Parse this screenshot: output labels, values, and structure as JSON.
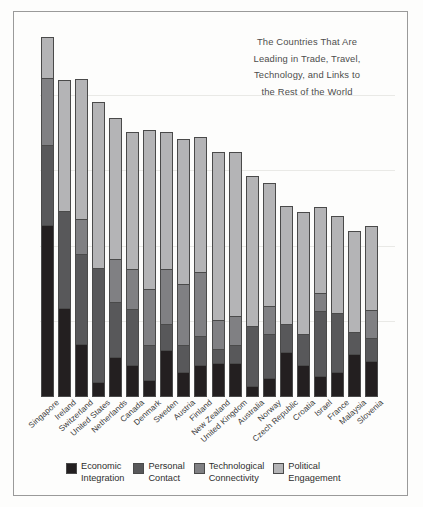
{
  "annotation": {
    "lines": [
      "The Countries That Are",
      "Leading in Trade, Travel,",
      "Technology, and Links to",
      "the Rest of the World"
    ]
  },
  "colors": {
    "economic_integration": "#231f20",
    "personal_contact": "#58585a",
    "technological_connectivity": "#808083",
    "political_engagement": "#b4b4b6",
    "bar_outline": "#4a4a4a",
    "frame": "#9a9a9a",
    "gridline": "#e9e9e6",
    "background": "#fdfdfc",
    "text": "#3a3a3a"
  },
  "legend": {
    "items": [
      {
        "label_line1": "Economic",
        "label_line2": "Integration",
        "key": "economic_integration"
      },
      {
        "label_line1": "Personal",
        "label_line2": "Contact",
        "key": "personal_contact"
      },
      {
        "label_line1": "Technological",
        "label_line2": "Connectivity",
        "key": "technological_connectivity"
      },
      {
        "label_line1": "Political",
        "label_line2": "Engagement",
        "key": "political_engagement"
      }
    ]
  },
  "chart_data": {
    "type": "bar",
    "subtype": "stacked-column",
    "xlabel": "",
    "ylabel": "",
    "ylim": [
      0,
      100
    ],
    "grid": true,
    "grid_values": [
      20,
      40,
      60,
      80
    ],
    "legend_position": "bottom",
    "axis_ticks_visible": false,
    "categories": [
      "Singapore",
      "Ireland",
      "Switzerland",
      "United States",
      "Netherlands",
      "Canada",
      "Denmark",
      "Sweden",
      "Austria",
      "Finland",
      "New Zealand",
      "United Kingdom",
      "Australia",
      "Norway",
      "Czech Republic",
      "Croatia",
      "Israel",
      "France",
      "Malaysia",
      "Slovenia"
    ],
    "series": [
      {
        "name": "Economic Integration",
        "color": "#231f20",
        "values": [
          45.5,
          23.5,
          14.0,
          4.0,
          10.5,
          8.5,
          4.5,
          12.5,
          6.5,
          8.5,
          9.0,
          9.0,
          3.0,
          5.0,
          12.0,
          8.5,
          5.5,
          6.5,
          11.5,
          9.5
        ]
      },
      {
        "name": "Personal Contact",
        "color": "#58585a",
        "values": [
          21.5,
          26.0,
          24.0,
          30.5,
          15.0,
          15.0,
          9.5,
          7.0,
          7.5,
          8.0,
          4.0,
          5.0,
          16.0,
          12.0,
          7.5,
          8.5,
          17.5,
          16.0,
          6.0,
          6.5
        ]
      },
      {
        "name": "Technological Connectivity",
        "color": "#808083",
        "values": [
          18.0,
          0.0,
          9.5,
          0.0,
          11.5,
          11.0,
          15.0,
          15.0,
          16.5,
          17.0,
          8.0,
          8.0,
          0.0,
          7.5,
          0.0,
          0.0,
          5.0,
          0.0,
          0.0,
          7.5
        ]
      },
      {
        "name": "Political Engagement",
        "color": "#b4b4b6",
        "values": [
          11.0,
          35.0,
          37.5,
          44.0,
          37.5,
          36.5,
          42.5,
          36.5,
          38.5,
          36.0,
          44.5,
          43.5,
          40.0,
          33.0,
          31.5,
          32.5,
          23.0,
          26.0,
          27.0,
          22.5
        ]
      }
    ],
    "totals": [
      96.0,
      84.5,
      85.0,
      78.5,
      74.5,
      71.0,
      71.5,
      71.0,
      69.0,
      69.5,
      65.5,
      65.5,
      59.0,
      57.5,
      51.0,
      49.5,
      51.0,
      48.5,
      44.5,
      46.0
    ]
  }
}
